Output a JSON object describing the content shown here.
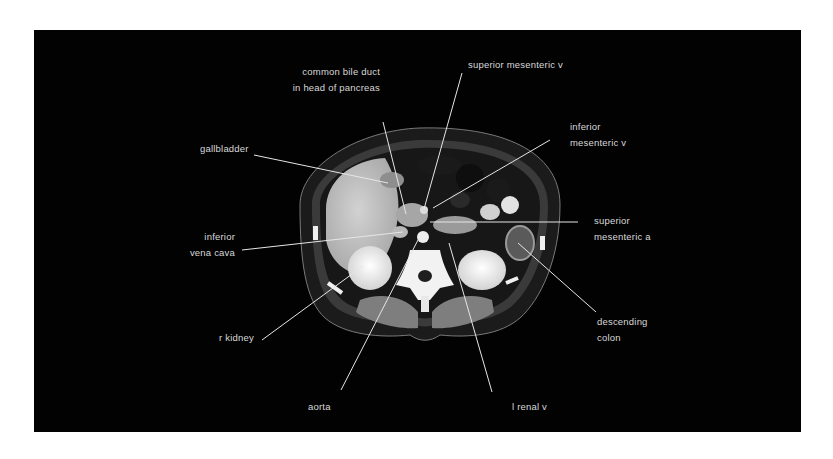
{
  "figure": {
    "type": "axial CT scan of abdomen (labeled)",
    "background_color": "#020202",
    "label_color": "#d8d8d8",
    "leader_color": "#e6e6e6"
  },
  "labels": {
    "common_bile_duct": {
      "line1": "common bile duct",
      "line2": "in head of pancreas"
    },
    "superior_mesenteric_v": {
      "line1": "superior mesenteric v"
    },
    "inferior_mesenteric_v": {
      "line1": "inferior",
      "line2": "mesenteric v"
    },
    "gallbladder": {
      "line1": "gallbladder"
    },
    "superior_mesenteric_a": {
      "line1": "superior",
      "line2": "mesenteric a"
    },
    "inferior_vena_cava": {
      "line1": "inferior",
      "line2": "vena cava"
    },
    "descending_colon": {
      "line1": "descending",
      "line2": "colon"
    },
    "r_kidney": {
      "line1": "r kidney"
    },
    "aorta": {
      "line1": "aorta"
    },
    "l_renal_v": {
      "line1": "l renal v"
    }
  }
}
